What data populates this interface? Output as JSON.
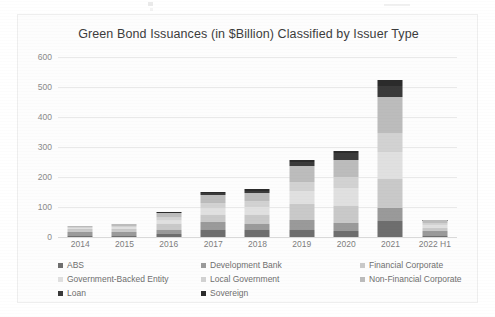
{
  "chart_data": {
    "type": "bar",
    "subtype": "stacked-bar",
    "title": "Green Bond Issuances (in $Billion) Classified by Issuer Type",
    "xlabel": "",
    "ylabel": "",
    "ylim": [
      0,
      600
    ],
    "ytick_step": 100,
    "yticks": [
      0,
      100,
      200,
      300,
      400,
      500,
      600
    ],
    "ytick_labels": [
      "0",
      "100",
      "200",
      "300",
      "400",
      "500",
      "600"
    ],
    "grid": true,
    "grid_axis": "y",
    "legend_position": "bottom",
    "legend_columns": 3,
    "categories": [
      "2014",
      "2015",
      "2016",
      "2017",
      "2018",
      "2019",
      "2020",
      "2021",
      "2022 H1"
    ],
    "series": [
      {
        "name": "ABS",
        "color": "#6e6e6e",
        "values": [
          3,
          4,
          9,
          24,
          22,
          22,
          19,
          52,
          5
        ]
      },
      {
        "name": "Development Bank",
        "color": "#9a9a9a",
        "values": [
          14,
          12,
          14,
          26,
          22,
          36,
          28,
          45,
          14
        ]
      },
      {
        "name": "Financial Corporate",
        "color": "#c9c9c9",
        "values": [
          9,
          10,
          21,
          25,
          30,
          53,
          58,
          96,
          12
        ]
      },
      {
        "name": "Government-Backed Entity",
        "color": "#e0e0e0",
        "values": [
          4,
          7,
          14,
          22,
          27,
          44,
          59,
          92,
          10
        ]
      },
      {
        "name": "Local Government",
        "color": "#d2d2d2",
        "values": [
          3,
          4,
          8,
          15,
          18,
          30,
          36,
          62,
          6
        ]
      },
      {
        "name": "Non-Financial Corporate",
        "color": "#bcbcbc",
        "values": [
          4,
          5,
          13,
          27,
          29,
          52,
          57,
          120,
          9
        ]
      },
      {
        "name": "Loan",
        "color": "#3a3a3a",
        "values": [
          0,
          0,
          0,
          8,
          6,
          14,
          22,
          35,
          1
        ]
      },
      {
        "name": "Sovereign",
        "color": "#2b2b2b",
        "values": [
          0,
          0,
          3,
          3,
          6,
          7,
          8,
          23,
          1
        ]
      }
    ],
    "totals": [
      37,
      42,
      82,
      150,
      160,
      258,
      287,
      525,
      58
    ]
  },
  "legend": {
    "items": [
      {
        "label": "ABS",
        "color": "#6e6e6e"
      },
      {
        "label": "Development Bank",
        "color": "#9a9a9a"
      },
      {
        "label": "Financial Corporate",
        "color": "#c9c9c9"
      },
      {
        "label": "Government-Backed Entity",
        "color": "#e0e0e0"
      },
      {
        "label": "Local Government",
        "color": "#d2d2d2"
      },
      {
        "label": "Non-Financial Corporate",
        "color": "#bcbcbc"
      },
      {
        "label": "Loan",
        "color": "#3a3a3a"
      },
      {
        "label": "Sovereign",
        "color": "#2b2b2b"
      }
    ]
  },
  "colors": {
    "page_background": "#ffffff",
    "card_background": "#fdfdfd",
    "card_border": "#eeeeee",
    "title_text": "#3c3c3c",
    "axis_text": "#8a8a8a",
    "gridline": "#e9e9e9"
  }
}
